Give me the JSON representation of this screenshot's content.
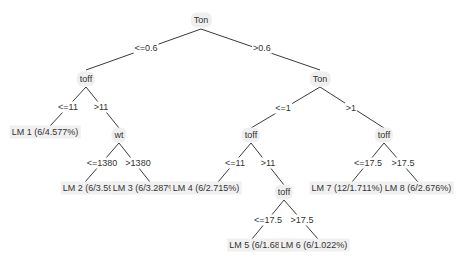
{
  "tree": {
    "nodes": [
      {
        "id": "n0",
        "label": "Ton",
        "x": 201,
        "y": 20
      },
      {
        "id": "n1",
        "label": "toff",
        "x": 86,
        "y": 79
      },
      {
        "id": "n2",
        "label": "Ton",
        "x": 320,
        "y": 79
      },
      {
        "id": "n3",
        "label": "wt",
        "x": 119,
        "y": 135
      },
      {
        "id": "n4",
        "label": "toff",
        "x": 251,
        "y": 135
      },
      {
        "id": "n5",
        "label": "toff",
        "x": 384,
        "y": 135
      },
      {
        "id": "n6",
        "label": "toff",
        "x": 284,
        "y": 192
      }
    ],
    "leaves": [
      {
        "id": "lm1",
        "label": "LM 1 (6/4.577%)",
        "x": 45,
        "y": 132
      },
      {
        "id": "lm2",
        "label": "LM 2 (6/3.593%)",
        "x": 96,
        "y": 188
      },
      {
        "id": "lm3",
        "label": "LM 3 (6/3.287%)",
        "x": 146,
        "y": 188
      },
      {
        "id": "lm4",
        "label": "LM 4 (6/2.715%)",
        "x": 206,
        "y": 188
      },
      {
        "id": "lm5",
        "label": "LM 5 (6/1.68%)",
        "x": 260,
        "y": 245
      },
      {
        "id": "lm6",
        "label": "LM 6 (6/1.022%)",
        "x": 314,
        "y": 245
      },
      {
        "id": "lm7",
        "label": "LM 7 (12/1.711%)",
        "x": 347,
        "y": 188
      },
      {
        "id": "lm8",
        "label": "LM 8 (6/2.676%)",
        "x": 418,
        "y": 188
      }
    ],
    "edges": [
      {
        "from": "n0",
        "to": "n1",
        "label": "<=0.6",
        "x1": 201,
        "y1": 29,
        "x2": 86,
        "y2": 70,
        "lx": 146,
        "ly": 48
      },
      {
        "from": "n0",
        "to": "n2",
        "label": ">0.6",
        "x1": 201,
        "y1": 29,
        "x2": 320,
        "y2": 70,
        "lx": 262,
        "ly": 48
      },
      {
        "from": "n1",
        "to": "lm1",
        "label": "<=11",
        "x1": 86,
        "y1": 87,
        "x2": 50,
        "y2": 126,
        "lx": 68,
        "ly": 107
      },
      {
        "from": "n1",
        "to": "n3",
        "label": ">11",
        "x1": 86,
        "y1": 87,
        "x2": 119,
        "y2": 128,
        "lx": 101,
        "ly": 107
      },
      {
        "from": "n3",
        "to": "lm2",
        "label": "<=1380",
        "x1": 119,
        "y1": 143,
        "x2": 85,
        "y2": 182,
        "lx": 102,
        "ly": 163
      },
      {
        "from": "n3",
        "to": "lm3",
        "label": ">1380",
        "x1": 119,
        "y1": 143,
        "x2": 150,
        "y2": 182,
        "lx": 138,
        "ly": 163
      },
      {
        "from": "n2",
        "to": "n4",
        "label": "<=1",
        "x1": 320,
        "y1": 87,
        "x2": 251,
        "y2": 128,
        "lx": 283,
        "ly": 108
      },
      {
        "from": "n2",
        "to": "n5",
        "label": ">1",
        "x1": 320,
        "y1": 87,
        "x2": 384,
        "y2": 128,
        "lx": 351,
        "ly": 108
      },
      {
        "from": "n4",
        "to": "lm4",
        "label": "<=11",
        "x1": 251,
        "y1": 143,
        "x2": 218,
        "y2": 182,
        "lx": 235,
        "ly": 163
      },
      {
        "from": "n4",
        "to": "n6",
        "label": ">11",
        "x1": 251,
        "y1": 143,
        "x2": 284,
        "y2": 185,
        "lx": 268,
        "ly": 163
      },
      {
        "from": "n6",
        "to": "lm5",
        "label": "<=17.5",
        "x1": 284,
        "y1": 200,
        "x2": 252,
        "y2": 239,
        "lx": 268,
        "ly": 220
      },
      {
        "from": "n6",
        "to": "lm6",
        "label": ">17.5",
        "x1": 284,
        "y1": 200,
        "x2": 318,
        "y2": 239,
        "lx": 302,
        "ly": 220
      },
      {
        "from": "n5",
        "to": "lm7",
        "label": "<=17.5",
        "x1": 384,
        "y1": 143,
        "x2": 352,
        "y2": 182,
        "lx": 368,
        "ly": 163
      },
      {
        "from": "n5",
        "to": "lm8",
        "label": ">17.5",
        "x1": 384,
        "y1": 143,
        "x2": 418,
        "y2": 182,
        "lx": 403,
        "ly": 163
      }
    ]
  }
}
